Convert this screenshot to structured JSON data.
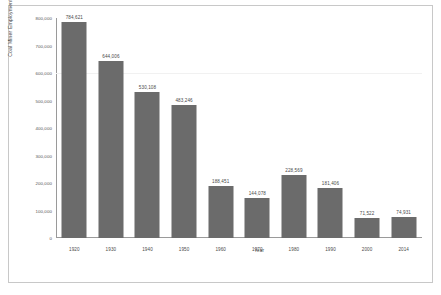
{
  "chart_data": {
    "type": "bar",
    "title": "",
    "xlabel": "Year",
    "ylabel": "Coal Miner Employment",
    "categories": [
      "1920",
      "1930",
      "1940",
      "1950",
      "1960",
      "1970",
      "1980",
      "1990",
      "2000",
      "2014"
    ],
    "values": [
      784621,
      644006,
      530108,
      483246,
      188451,
      144078,
      228569,
      181406,
      71522,
      74931
    ],
    "value_labels": [
      "784,621",
      "644,006",
      "530,108",
      "483,246",
      "188,451",
      "144,078",
      "228,569",
      "181,406",
      "71,522",
      "74,931"
    ],
    "ylim": [
      0,
      800000
    ],
    "yticks": [
      0,
      100000,
      200000,
      300000,
      400000,
      500000,
      600000,
      700000,
      800000
    ],
    "ytick_labels": [
      "0",
      "100,000",
      "200,000",
      "300,000",
      "400,000",
      "500,000",
      "600,000",
      "700,000",
      "800,000"
    ],
    "grid": true,
    "legend": null,
    "bar_color": "#6b6b6b",
    "axis_color": "#9a9a9a",
    "grid_color": "#f1f1f1",
    "background": "#ffffff"
  }
}
